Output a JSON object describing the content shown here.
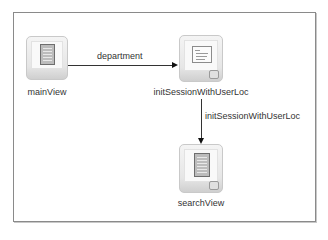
{
  "diagram": {
    "type": "page-flow",
    "nodes": [
      {
        "id": "mainView",
        "label": "mainView",
        "icon": "page-view-icon"
      },
      {
        "id": "initSessionWithUserLoc",
        "label": "initSessionWithUserLoc",
        "icon": "method-call-activity-icon"
      },
      {
        "id": "searchView",
        "label": "searchView",
        "icon": "page-view-icon"
      }
    ],
    "edges": [
      {
        "from": "mainView",
        "to": "initSessionWithUserLoc",
        "label": "department"
      },
      {
        "from": "initSessionWithUserLoc",
        "to": "searchView",
        "label": "initSessionWithUserLoc"
      }
    ]
  }
}
